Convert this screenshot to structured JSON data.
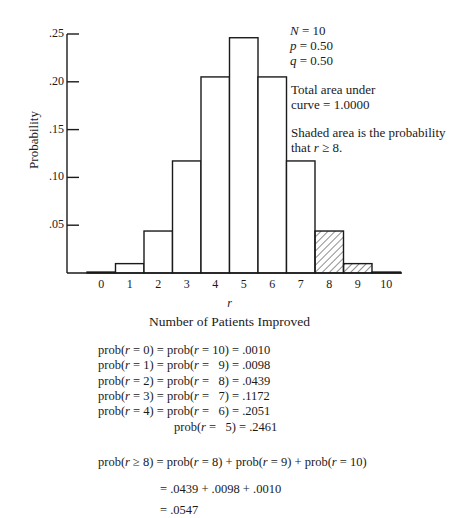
{
  "chart_data": {
    "type": "bar",
    "title": "",
    "xlabel": "Number of Patients Improved",
    "xvar": "r",
    "ylabel": "Probability",
    "ylim": [
      0,
      0.25
    ],
    "yticks": [
      ".05",
      ".10",
      ".15",
      ".20",
      ".25"
    ],
    "categories": [
      "0",
      "1",
      "2",
      "3",
      "4",
      "5",
      "6",
      "7",
      "8",
      "9",
      "10"
    ],
    "values": [
      0.001,
      0.0098,
      0.0439,
      0.1172,
      0.2051,
      0.2461,
      0.2051,
      0.1172,
      0.0439,
      0.0098,
      0.001
    ],
    "shaded_categories": [
      "8",
      "9",
      "10"
    ],
    "grid": false
  },
  "annotations": {
    "n_line": "N = 10",
    "p_line": "p = 0.50",
    "q_line": "q = 0.50",
    "total_area_1": "Total area under",
    "total_area_2": "curve = 1.0000",
    "shaded_1": "Shaded area is the probability",
    "shaded_2": "that r ≥ 8."
  },
  "equations": {
    "rows": [
      "prob(r = 0) = prob(r = 10) = .0010",
      "prob(r = 1) = prob(r =   9) = .0098",
      "prob(r = 2) = prob(r =   8) = .0439",
      "prob(r = 3) = prob(r =   7) = .1172",
      "prob(r = 4) = prob(r =   6) = .2051",
      "                     prob(r =   5) = .2461"
    ],
    "sum_line": "prob(r ≥ 8) = prob(r = 8) + prob(r = 9) + prob(r = 10)",
    "sum_values": "= .0439 + .0098 + .0010",
    "result": "= .0547"
  }
}
